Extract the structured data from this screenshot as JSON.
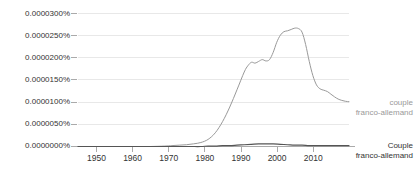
{
  "chart_data": {
    "type": "line",
    "title": "",
    "subtitle": "",
    "xlabel": "",
    "ylabel": "",
    "xlim": [
      1944,
      2019
    ],
    "ylim": [
      0,
      3e-05
    ],
    "grid": true,
    "legend_position": "right",
    "y_ticks": [
      "0.0000300%",
      "0.0000250%",
      "0.0000200%",
      "0.0000150%",
      "0.0000100%",
      "0.0000050%",
      "0.0000000%"
    ],
    "y_tick_values": [
      3e-06,
      2.5e-06,
      2e-06,
      1.5e-06,
      1e-06,
      5e-07,
      0.0
    ],
    "x_ticks": [
      "1950",
      "1960",
      "1970",
      "1980",
      "1990",
      "2000",
      "2010"
    ],
    "x_tick_values": [
      1950,
      1960,
      1970,
      1980,
      1990,
      2000,
      2010
    ],
    "colors": {
      "series_lowercase": "#999999",
      "series_capitalized": "#555555",
      "grid": "#e8e8e8",
      "axis": "#bbbbbb",
      "text": "#333333",
      "muted_text": "#999999",
      "background": "#ffffff"
    },
    "series": [
      {
        "name": "couple franco-allemand",
        "color": "#999999",
        "x": [
          1944,
          1948,
          1952,
          1956,
          1960,
          1964,
          1968,
          1970,
          1972,
          1974,
          1976,
          1978,
          1980,
          1982,
          1984,
          1986,
          1988,
          1990,
          1991,
          1992,
          1993,
          1994,
          1995,
          1996,
          1997,
          1998,
          1999,
          2000,
          2001,
          2002,
          2003,
          2004,
          2005,
          2006,
          2007,
          2008,
          2009,
          2010,
          2011,
          2012,
          2013,
          2014,
          2015,
          2016,
          2017,
          2018,
          2019
        ],
        "values": [
          0.0,
          0.0,
          0.0,
          0.0,
          0.0,
          0.0,
          1e-07,
          2e-07,
          3e-07,
          4e-07,
          6e-07,
          9e-07,
          1.6e-06,
          3.1e-06,
          5.6e-06,
          8.9e-06,
          1.28e-05,
          1.68e-05,
          1.82e-05,
          1.9e-05,
          1.88e-05,
          1.92e-05,
          1.96e-05,
          1.93e-05,
          1.96e-05,
          2.12e-05,
          2.35e-05,
          2.51e-05,
          2.59e-05,
          2.61e-05,
          2.64e-05,
          2.67e-05,
          2.66e-05,
          2.58e-05,
          2.3e-05,
          1.92e-05,
          1.6e-05,
          1.39e-05,
          1.3e-05,
          1.27e-05,
          1.24e-05,
          1.18e-05,
          1.12e-05,
          1.07e-05,
          1.04e-05,
          1.02e-05,
          1.01e-05
        ]
      },
      {
        "name": "Couple franco-allemand",
        "color": "#555555",
        "x": [
          1944,
          1950,
          1955,
          1960,
          1965,
          1970,
          1975,
          1978,
          1980,
          1982,
          1984,
          1986,
          1988,
          1990,
          1992,
          1994,
          1996,
          1998,
          2000,
          2002,
          2004,
          2006,
          2008,
          2010,
          2012,
          2014,
          2016,
          2018,
          2019
        ],
        "values": [
          0.0,
          0.0,
          0.0,
          0.0,
          0.0,
          0.0,
          0.0,
          0.0,
          1e-07,
          1e-07,
          2e-07,
          2e-07,
          3e-07,
          4e-07,
          5e-07,
          6e-07,
          6e-07,
          6e-07,
          5e-07,
          4e-07,
          3e-07,
          3e-07,
          2e-07,
          2e-07,
          2e-07,
          2e-07,
          2e-07,
          2e-07,
          2e-07
        ]
      }
    ],
    "legend": [
      {
        "line1": "couple",
        "line2": "franco-allemand",
        "color": "#999999"
      },
      {
        "line1": "Couple",
        "line2": "franco-allemand",
        "color": "#555555"
      }
    ]
  }
}
